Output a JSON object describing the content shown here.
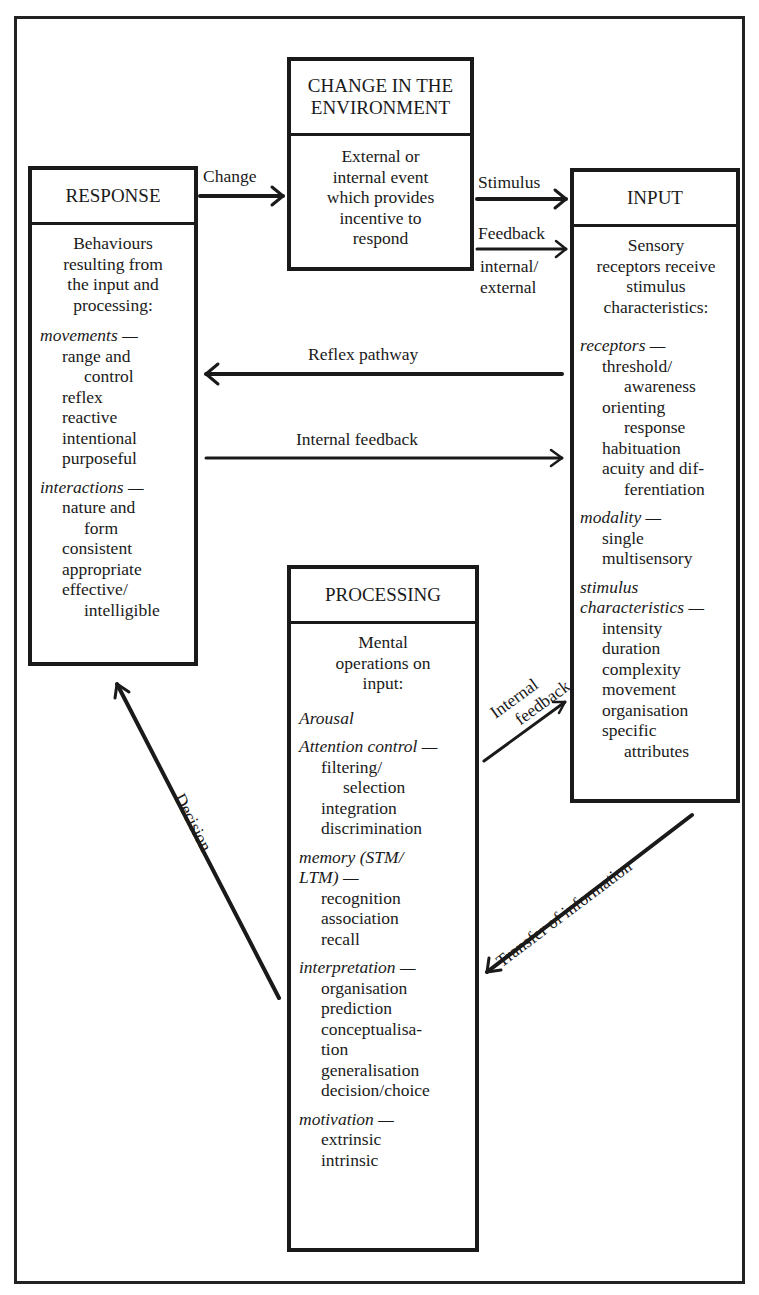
{
  "boxes": {
    "change": {
      "title": "CHANGE IN THE ENVIRONMENT",
      "title_line1": "CHANGE IN THE",
      "title_line2": "ENVIRONMENT",
      "intro_lines": [
        "External or",
        "internal event",
        "which provides",
        "incentive to",
        "respond"
      ]
    },
    "response": {
      "title": "RESPONSE",
      "intro_lines": [
        "Behaviours",
        "resulting from",
        "the input and",
        "processing:"
      ],
      "sections": [
        {
          "title": "movements —",
          "items": [
            "range and",
            "control",
            "reflex",
            "reactive",
            "intentional",
            "purposeful"
          ]
        },
        {
          "title": "interactions —",
          "items": [
            "nature and",
            "form",
            "consistent",
            "appropriate",
            "effective/",
            "intelligible"
          ]
        }
      ]
    },
    "input": {
      "title": "INPUT",
      "intro_lines": [
        "Sensory",
        "receptors receive",
        "stimulus",
        "characteristics:"
      ],
      "sections": [
        {
          "title": "receptors —",
          "items": [
            "threshold/",
            "awareness",
            "orienting",
            "response",
            "habituation",
            "acuity and dif-",
            "ferentiation"
          ]
        },
        {
          "title": "modality —",
          "items": [
            "single",
            "multisensory"
          ]
        },
        {
          "title": "stimulus characteristics —",
          "title_line1": "stimulus",
          "title_line2": "characteristics —",
          "items": [
            "intensity",
            "duration",
            "complexity",
            "movement",
            "organisation",
            "specific",
            "attributes"
          ]
        }
      ]
    },
    "processing": {
      "title": "PROCESSING",
      "intro_lines": [
        "Mental",
        "operations on",
        "input:"
      ],
      "sections": [
        {
          "title": "Arousal",
          "items": []
        },
        {
          "title": "Attention control —",
          "items": [
            "filtering/",
            "selection",
            "integration",
            "discrimination"
          ]
        },
        {
          "title": "memory (STM/ LTM) —",
          "title_line1": "memory (STM/",
          "title_line2": "LTM) —",
          "items": [
            "recognition",
            "association",
            "recall"
          ]
        },
        {
          "title": "interpretation —",
          "items": [
            "organisation",
            "prediction",
            "conceptualisa-",
            "tion",
            "generalisation",
            "decision/choice"
          ]
        },
        {
          "title": "motivation —",
          "items": [
            "extrinsic",
            "intrinsic"
          ]
        }
      ]
    }
  },
  "arrows": {
    "change": "Change",
    "stimulus": "Stimulus",
    "feedback": "Feedback",
    "feedback_sub_line1": "internal/",
    "feedback_sub_line2": "external",
    "reflex": "Reflex pathway",
    "internal_feedback": "Internal feedback",
    "internal_feedback_diag_line1": "Internal",
    "internal_feedback_diag_line2": "feedback",
    "transfer": "Transfer of information",
    "decision": "Decision"
  },
  "colors": {
    "ink": "#1a1a1a",
    "paper": "#ffffff"
  }
}
